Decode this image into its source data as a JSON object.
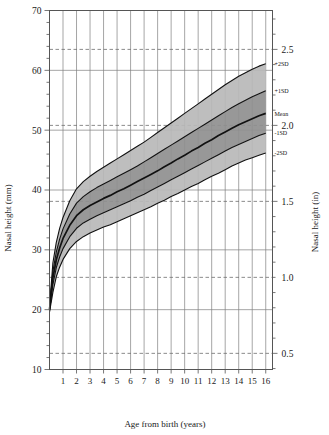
{
  "chart_data": {
    "type": "line",
    "title": "",
    "xlabel": "Age from birth (years)",
    "ylabel": "Nasal height (mm)",
    "ylabel_right": "Nasal height (in)",
    "xlim": [
      0,
      16.5
    ],
    "ylim": [
      10,
      70
    ],
    "ylim_right": [
      0.394,
      2.756
    ],
    "grid": true,
    "legend_position": "right-inline",
    "x_ticks": [
      1,
      2,
      3,
      4,
      5,
      6,
      7,
      8,
      9,
      10,
      11,
      12,
      13,
      14,
      15,
      16
    ],
    "x_tick_labels": [
      "1",
      "2",
      "3",
      "4",
      "5",
      "6",
      "7",
      "8",
      "9",
      "10",
      "11",
      "12",
      "13",
      "14",
      "15",
      "16"
    ],
    "y_ticks": [
      10,
      20,
      30,
      40,
      50,
      60,
      70
    ],
    "y_tick_labels": [
      "10",
      "20",
      "30",
      "40",
      "50",
      "60",
      "70"
    ],
    "y_minor_tick_step": 2,
    "y_right_ticks_in": [
      0.5,
      1.0,
      1.5,
      2.0,
      2.5
    ],
    "y_right_tick_labels": [
      "0.5",
      "1.0",
      "1.5",
      "2.0",
      "2.5"
    ],
    "dashed_inch_gridlines_mm": [
      12.7,
      25.4,
      38.1,
      50.8,
      63.5
    ],
    "band_fill_outer": "#b9b9b9",
    "band_fill_inner": "#8f8f8f",
    "curve_color": "#111111",
    "grid_color": "#808080",
    "dash_color": "#6f6f6f",
    "axis_color": "#555555",
    "x": [
      0,
      0.25,
      0.5,
      0.75,
      1,
      1.5,
      2,
      2.5,
      3,
      3.5,
      4,
      4.5,
      5,
      5.5,
      6,
      6.5,
      7,
      7.5,
      8,
      8.5,
      9,
      9.5,
      10,
      10.5,
      11,
      11.5,
      12,
      12.5,
      13,
      13.5,
      14,
      14.5,
      15,
      15.5,
      16
    ],
    "series": [
      {
        "name": "+2SD",
        "label": "+2SD",
        "values": [
          20.4,
          27.8,
          31.2,
          33.6,
          35.4,
          38.2,
          40.2,
          41.4,
          42.3,
          43.1,
          43.8,
          44.5,
          45.2,
          45.9,
          46.6,
          47.3,
          48.0,
          48.8,
          49.6,
          50.4,
          51.2,
          52.0,
          52.8,
          53.6,
          54.4,
          55.2,
          56.0,
          56.8,
          57.6,
          58.3,
          59.0,
          59.6,
          60.2,
          60.7,
          61.1
        ]
      },
      {
        "name": "+1SD",
        "label": "+1SD",
        "values": [
          20.2,
          26.4,
          29.6,
          31.8,
          33.5,
          36.0,
          37.8,
          38.9,
          39.7,
          40.4,
          41.0,
          41.6,
          42.2,
          42.8,
          43.4,
          44.0,
          44.7,
          45.4,
          46.1,
          46.8,
          47.5,
          48.2,
          48.9,
          49.6,
          50.3,
          51.0,
          51.7,
          52.4,
          53.1,
          53.8,
          54.4,
          55.0,
          55.6,
          56.1,
          56.6
        ]
      },
      {
        "name": "Mean",
        "label": "Mean",
        "values": [
          20.0,
          25.3,
          28.3,
          30.3,
          31.9,
          34.1,
          35.7,
          36.7,
          37.4,
          38.0,
          38.6,
          39.1,
          39.7,
          40.2,
          40.8,
          41.4,
          42.0,
          42.6,
          43.2,
          43.9,
          44.5,
          45.2,
          45.8,
          46.5,
          47.1,
          47.8,
          48.4,
          49.1,
          49.7,
          50.3,
          50.9,
          51.4,
          51.9,
          52.4,
          52.8
        ]
      },
      {
        "name": "-1SD",
        "label": "-1SD",
        "values": [
          19.8,
          24.2,
          27.0,
          28.8,
          30.2,
          32.2,
          33.6,
          34.5,
          35.1,
          35.7,
          36.2,
          36.7,
          37.2,
          37.7,
          38.2,
          38.8,
          39.3,
          39.9,
          40.5,
          41.1,
          41.7,
          42.3,
          42.9,
          43.5,
          44.1,
          44.7,
          45.3,
          45.9,
          46.5,
          47.1,
          47.6,
          48.1,
          48.6,
          49.1,
          49.5
        ]
      },
      {
        "name": "-2SD",
        "label": "-2SD",
        "values": [
          19.6,
          22.9,
          25.5,
          27.1,
          28.4,
          30.2,
          31.4,
          32.2,
          32.8,
          33.3,
          33.8,
          34.2,
          34.7,
          35.2,
          35.7,
          36.2,
          36.7,
          37.2,
          37.8,
          38.3,
          38.9,
          39.4,
          40.0,
          40.6,
          41.1,
          41.7,
          42.3,
          42.8,
          43.4,
          44.0,
          44.5,
          45.0,
          45.4,
          45.8,
          46.2
        ]
      }
    ]
  }
}
